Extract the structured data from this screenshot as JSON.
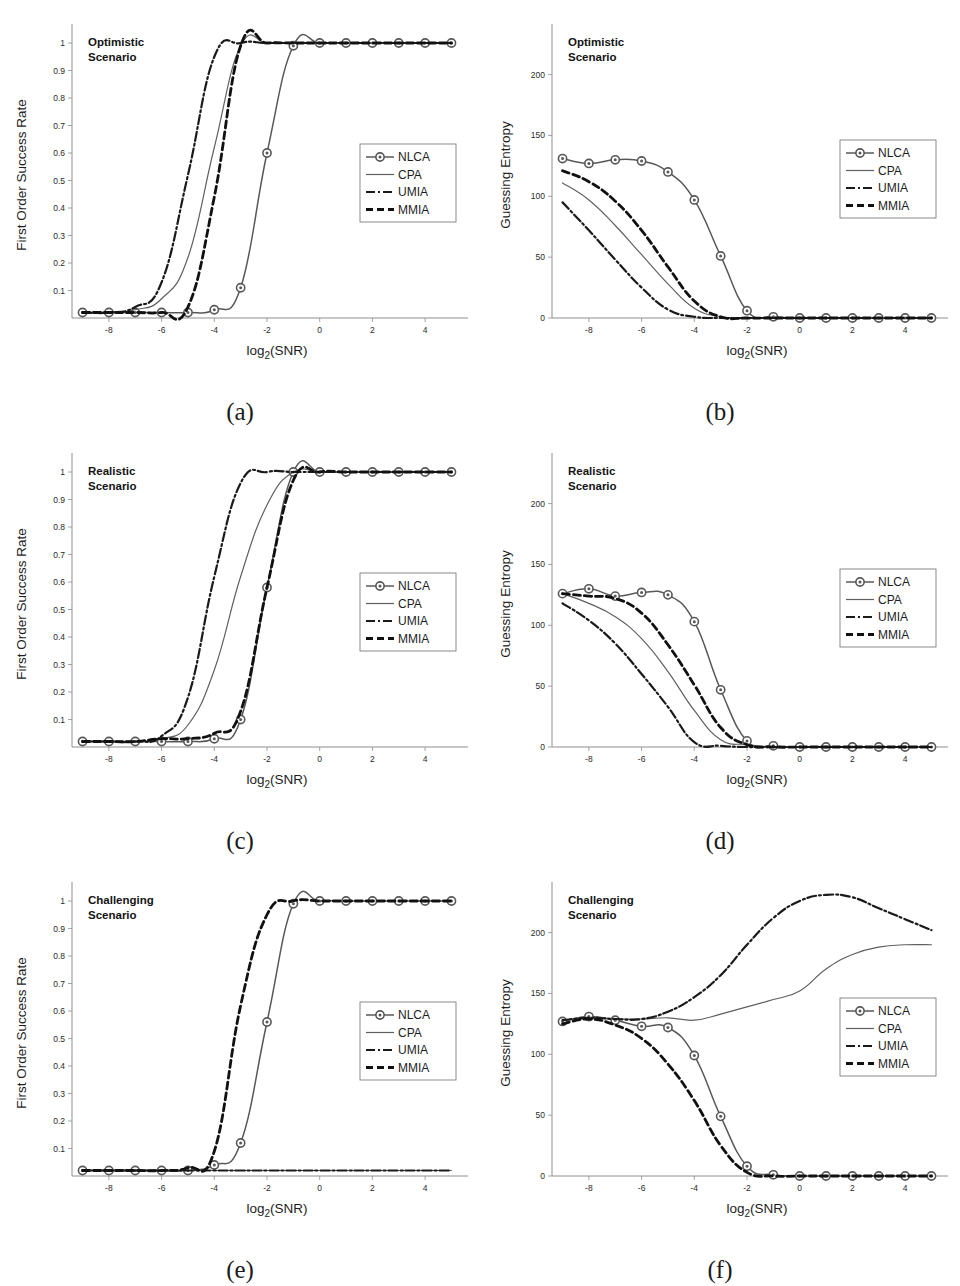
{
  "figure": {
    "series_names": [
      "NLCA",
      "CPA",
      "UMIA",
      "MMIA"
    ],
    "x_axis_label_main": "log",
    "x_axis_label_sub": "2",
    "x_axis_label_tail": "(SNR)",
    "xticks": [
      "-8",
      "-6",
      "-4",
      "-2",
      "0",
      "2",
      "4"
    ],
    "sr_yticks": [
      "0.1",
      "0.2",
      "0.3",
      "0.4",
      "0.5",
      "0.6",
      "0.7",
      "0.8",
      "0.9",
      "1"
    ],
    "ge_yticks": [
      "0",
      "50",
      "100",
      "150",
      "200"
    ],
    "sr_ylabel": "First Order Success Rate",
    "ge_ylabel": "Guessing Entropy",
    "colors": {
      "nlca": "#585858",
      "cpa": "#606060",
      "umia": "#1a1a1a",
      "mmia": "#111111",
      "axis": "#8e8e8e",
      "text": "#1d1d1d"
    },
    "panels": [
      {
        "id": "a",
        "label": "(a)",
        "scenario_line1": "Optimistic",
        "scenario_line2": "Scenario",
        "metric": "sr"
      },
      {
        "id": "b",
        "label": "(b)",
        "scenario_line1": "Optimistic",
        "scenario_line2": "Scenario",
        "metric": "ge"
      },
      {
        "id": "c",
        "label": "(c)",
        "scenario_line1": "Realistic",
        "scenario_line2": "Scenario",
        "metric": "sr"
      },
      {
        "id": "d",
        "label": "(d)",
        "scenario_line1": "Realistic",
        "scenario_line2": "Scenario",
        "metric": "ge"
      },
      {
        "id": "e",
        "label": "(e)",
        "scenario_line1": "Challenging",
        "scenario_line2": "Scenario",
        "metric": "sr"
      },
      {
        "id": "f",
        "label": "(f)",
        "scenario_line1": "Challenging",
        "scenario_line2": "Scenario",
        "metric": "ge"
      }
    ]
  },
  "chart_data": [
    {
      "panel": "a",
      "type": "line",
      "title": "Optimistic Scenario",
      "xlabel": "log2(SNR)",
      "ylabel": "First Order Success Rate",
      "xlim": [
        -9.4,
        5.4
      ],
      "ylim": [
        0.0,
        1.04
      ],
      "grid": false,
      "legend_position": "center-right",
      "x": [
        -9,
        -8,
        -7,
        -6,
        -5,
        -4,
        -3,
        -2,
        -1,
        0,
        1,
        2,
        3,
        4,
        5
      ],
      "series": [
        {
          "name": "NLCA",
          "style": "solid-marker",
          "values": [
            0.02,
            0.02,
            0.02,
            0.02,
            0.02,
            0.03,
            0.11,
            0.6,
            0.99,
            1.0,
            1.0,
            1.0,
            1.0,
            1.0,
            1.0
          ]
        },
        {
          "name": "CPA",
          "style": "solid",
          "values": [
            0.02,
            0.02,
            0.03,
            0.07,
            0.22,
            0.62,
            0.99,
            1.0,
            1.0,
            1.0,
            1.0,
            1.0,
            1.0,
            1.0,
            1.0
          ]
        },
        {
          "name": "UMIA",
          "style": "dashdot",
          "values": [
            0.02,
            0.02,
            0.04,
            0.13,
            0.52,
            0.95,
            1.0,
            1.0,
            1.0,
            1.0,
            1.0,
            1.0,
            1.0,
            1.0,
            1.0
          ]
        },
        {
          "name": "MMIA",
          "style": "dashed",
          "values": [
            0.02,
            0.02,
            0.02,
            0.02,
            0.04,
            0.44,
            0.99,
            1.0,
            1.0,
            1.0,
            1.0,
            1.0,
            1.0,
            1.0,
            1.0
          ]
        }
      ]
    },
    {
      "panel": "b",
      "type": "line",
      "title": "Optimistic Scenario",
      "xlabel": "log2(SNR)",
      "ylabel": "Guessing Entropy",
      "xlim": [
        -9.4,
        5.4
      ],
      "ylim": [
        0,
        235
      ],
      "grid": false,
      "legend_position": "center-right",
      "x": [
        -9,
        -8,
        -7,
        -6,
        -5,
        -4,
        -3,
        -2,
        -1,
        0,
        1,
        2,
        3,
        4,
        5
      ],
      "series": [
        {
          "name": "NLCA",
          "style": "solid-marker",
          "values": [
            131,
            127,
            130,
            129,
            120,
            97,
            51,
            6,
            1,
            0,
            0,
            0,
            0,
            0,
            0
          ]
        },
        {
          "name": "CPA",
          "style": "solid",
          "values": [
            111,
            97,
            76,
            52,
            28,
            8,
            1,
            0,
            0,
            0,
            0,
            0,
            0,
            0,
            0
          ]
        },
        {
          "name": "UMIA",
          "style": "dashdot",
          "values": [
            95,
            72,
            48,
            25,
            7,
            1,
            0,
            0,
            0,
            0,
            0,
            0,
            0,
            0,
            0
          ]
        },
        {
          "name": "MMIA",
          "style": "dashed",
          "values": [
            121,
            112,
            96,
            72,
            42,
            14,
            1,
            0,
            0,
            0,
            0,
            0,
            0,
            0,
            0
          ]
        }
      ]
    },
    {
      "panel": "c",
      "type": "line",
      "title": "Realistic Scenario",
      "xlabel": "log2(SNR)",
      "ylabel": "First Order Success Rate",
      "xlim": [
        -9.4,
        5.4
      ],
      "ylim": [
        0.0,
        1.04
      ],
      "grid": false,
      "legend_position": "center-right",
      "x": [
        -9,
        -8,
        -7,
        -6,
        -5,
        -4,
        -3,
        -2,
        -1,
        0,
        1,
        2,
        3,
        4,
        5
      ],
      "series": [
        {
          "name": "NLCA",
          "style": "solid-marker",
          "values": [
            0.02,
            0.02,
            0.02,
            0.02,
            0.02,
            0.03,
            0.1,
            0.58,
            1.0,
            1.0,
            1.0,
            1.0,
            1.0,
            1.0,
            1.0
          ]
        },
        {
          "name": "CPA",
          "style": "solid",
          "values": [
            0.02,
            0.02,
            0.02,
            0.03,
            0.08,
            0.28,
            0.62,
            0.88,
            1.0,
            1.0,
            1.0,
            1.0,
            1.0,
            1.0,
            1.0
          ]
        },
        {
          "name": "UMIA",
          "style": "dashdot",
          "values": [
            0.02,
            0.02,
            0.02,
            0.04,
            0.18,
            0.62,
            0.96,
            1.0,
            1.0,
            1.0,
            1.0,
            1.0,
            1.0,
            1.0,
            1.0
          ]
        },
        {
          "name": "MMIA",
          "style": "dashed",
          "values": [
            0.02,
            0.02,
            0.02,
            0.03,
            0.03,
            0.05,
            0.13,
            0.58,
            0.97,
            1.0,
            1.0,
            1.0,
            1.0,
            1.0,
            1.0
          ]
        }
      ]
    },
    {
      "panel": "d",
      "type": "line",
      "title": "Realistic Scenario",
      "xlabel": "log2(SNR)",
      "ylabel": "Guessing Entropy",
      "xlim": [
        -9.4,
        5.4
      ],
      "ylim": [
        0,
        235
      ],
      "grid": false,
      "legend_position": "center-right",
      "x": [
        -9,
        -8,
        -7,
        -6,
        -5,
        -4,
        -3,
        -2,
        -1,
        0,
        1,
        2,
        3,
        4,
        5
      ],
      "series": [
        {
          "name": "NLCA",
          "style": "solid-marker",
          "values": [
            126,
            130,
            124,
            127,
            125,
            103,
            47,
            5,
            1,
            0,
            0,
            0,
            0,
            0,
            0
          ]
        },
        {
          "name": "CPA",
          "style": "solid",
          "values": [
            126,
            118,
            107,
            89,
            62,
            30,
            6,
            2,
            0,
            0,
            0,
            0,
            0,
            0,
            0
          ]
        },
        {
          "name": "UMIA",
          "style": "dashdot",
          "values": [
            118,
            104,
            85,
            60,
            33,
            4,
            1,
            0,
            0,
            0,
            0,
            0,
            0,
            0,
            0
          ]
        },
        {
          "name": "MMIA",
          "style": "dashed",
          "values": [
            126,
            124,
            122,
            110,
            84,
            51,
            16,
            2,
            0,
            0,
            0,
            0,
            0,
            0,
            0
          ]
        }
      ]
    },
    {
      "panel": "e",
      "type": "line",
      "title": "Challenging Scenario",
      "xlabel": "log2(SNR)",
      "ylabel": "First Order Success Rate",
      "xlim": [
        -9.4,
        5.4
      ],
      "ylim": [
        0.0,
        1.04
      ],
      "grid": false,
      "legend_position": "center-right",
      "x": [
        -9,
        -8,
        -7,
        -6,
        -5,
        -4,
        -3,
        -2,
        -1,
        0,
        1,
        2,
        3,
        4,
        5
      ],
      "series": [
        {
          "name": "NLCA",
          "style": "solid-marker",
          "values": [
            0.02,
            0.02,
            0.02,
            0.02,
            0.02,
            0.04,
            0.12,
            0.56,
            0.99,
            1.0,
            1.0,
            1.0,
            1.0,
            1.0,
            1.0
          ]
        },
        {
          "name": "CPA",
          "style": "solid",
          "values": [
            0.02,
            0.02,
            0.02,
            0.02,
            0.02,
            0.02,
            0.02,
            0.02,
            0.02,
            0.02,
            0.02,
            0.02,
            0.02,
            0.02,
            0.02
          ]
        },
        {
          "name": "UMIA",
          "style": "dashdot",
          "values": [
            0.02,
            0.02,
            0.02,
            0.02,
            0.02,
            0.02,
            0.02,
            0.02,
            0.02,
            0.02,
            0.02,
            0.02,
            0.02,
            0.02,
            0.02
          ]
        },
        {
          "name": "MMIA",
          "style": "dashed",
          "values": [
            0.02,
            0.02,
            0.02,
            0.02,
            0.03,
            0.09,
            0.62,
            0.95,
            1.0,
            1.0,
            1.0,
            1.0,
            1.0,
            1.0,
            1.0
          ]
        }
      ]
    },
    {
      "panel": "f",
      "type": "line",
      "title": "Challenging Scenario",
      "xlabel": "log2(SNR)",
      "ylabel": "Guessing Entropy",
      "xlim": [
        -9.4,
        5.4
      ],
      "ylim": [
        0,
        235
      ],
      "grid": false,
      "legend_position": "center-right",
      "x": [
        -9,
        -8,
        -7,
        -6,
        -5,
        -4,
        -3,
        -2,
        -1,
        0,
        1,
        2,
        3,
        4,
        5
      ],
      "series": [
        {
          "name": "NLCA",
          "style": "solid-marker",
          "values": [
            127,
            131,
            128,
            123,
            122,
            99,
            49,
            8,
            1,
            0,
            0,
            0,
            0,
            0,
            0
          ]
        },
        {
          "name": "CPA",
          "style": "solid",
          "values": [
            128,
            130,
            129,
            129,
            130,
            128,
            133,
            139,
            145,
            152,
            170,
            182,
            188,
            190,
            190
          ]
        },
        {
          "name": "UMIA",
          "style": "dashdot",
          "values": [
            128,
            130,
            129,
            129,
            135,
            147,
            165,
            190,
            212,
            226,
            231,
            229,
            220,
            211,
            202
          ]
        },
        {
          "name": "MMIA",
          "style": "dashed",
          "values": [
            125,
            129,
            124,
            113,
            92,
            62,
            25,
            3,
            0,
            0,
            0,
            0,
            0,
            0,
            0
          ]
        }
      ]
    }
  ]
}
